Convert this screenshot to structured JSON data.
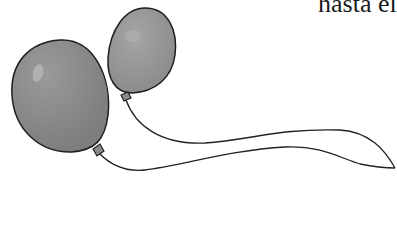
{
  "page": {
    "text_fragment": "hasta el"
  },
  "illustration": {
    "subject": "two balloons with strings",
    "balloon_fill": "#8a8a8a",
    "balloon_highlight": "#b8b8b8",
    "outline_color": "#222222",
    "background": "#ffffff"
  }
}
